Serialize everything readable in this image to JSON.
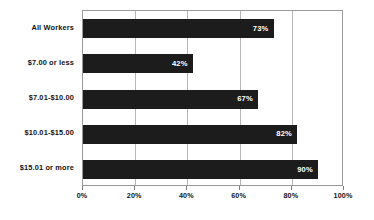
{
  "chart_data": {
    "type": "bar",
    "orientation": "horizontal",
    "title": "",
    "subtitle": "",
    "xlabel": "",
    "ylabel": "",
    "xlim": [
      0,
      100
    ],
    "grid": true,
    "legend": null,
    "legend_position": "none",
    "categories": [
      "All Workers",
      "$7.00 or less",
      "$7.01-$10.00",
      "$10.01-$15.00",
      "$15.01 or more"
    ],
    "values": [
      73,
      42,
      67,
      82,
      90
    ],
    "value_labels": [
      "73%",
      "42%",
      "67%",
      "82%",
      "90%"
    ],
    "xtick_values": [
      0,
      20,
      40,
      60,
      80,
      100
    ],
    "xtick_labels": [
      "0%",
      "20%",
      "40%",
      "60%",
      "80%",
      "100%"
    ],
    "colors": {
      "bar": "#1c1c1c",
      "bar_label": "#ffffff",
      "category_label": "#131313",
      "tick_label": "#131313",
      "gridline": "#b6b6b6",
      "plot_border": "#9a9a9a",
      "background": "#ffffff"
    }
  }
}
